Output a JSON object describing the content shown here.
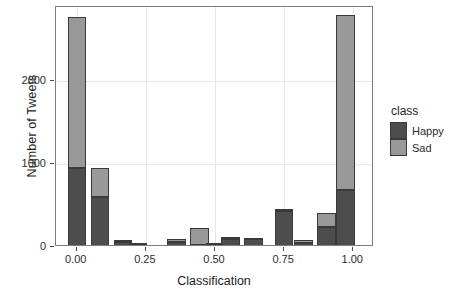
{
  "chart_data": {
    "type": "bar",
    "title": "",
    "xlabel": "Classification",
    "ylabel": "Number of Tweets",
    "xlim": [
      -0.075,
      1.075
    ],
    "ylim": [
      0,
      2900
    ],
    "xticks": [
      "0.00",
      "0.25",
      "0.50",
      "0.75",
      "1.00"
    ],
    "xtick_values": [
      0.0,
      0.25,
      0.5,
      0.75,
      1.0
    ],
    "yticks": [
      "0",
      "1000",
      "2000"
    ],
    "ytick_values": [
      0,
      1000,
      2000
    ],
    "grid": true,
    "stacked": true,
    "bin_width": 0.0667,
    "legend": {
      "title": "class",
      "position": "right",
      "entries": [
        {
          "label": "Happy",
          "color": "#4d4d4d"
        },
        {
          "label": "Sad",
          "color": "#999999"
        }
      ]
    },
    "series": [
      {
        "name": "Happy",
        "color": "#4d4d4d",
        "values": [
          950,
          600,
          60,
          40,
          10,
          60,
          30,
          35,
          100,
          100,
          440,
          50,
          240,
          690
        ]
      },
      {
        "name": "Sad",
        "color": "#999999",
        "values": [
          1830,
          360,
          25,
          10,
          5,
          35,
          195,
          15,
          15,
          10,
          20,
          35,
          170,
          2110
        ]
      }
    ],
    "bins": [
      {
        "x0": -0.0667,
        "x1": 0.0,
        "happy": 950,
        "sad": 1830,
        "total": 2780
      },
      {
        "x0": 0.0,
        "x1": 0.0667,
        "happy": 600,
        "sad": 360,
        "total": 960
      },
      {
        "x0": 0.0667,
        "x1": 0.1333,
        "happy": 60,
        "sad": 25,
        "total": 85
      },
      {
        "x0": 0.1333,
        "x1": 0.2,
        "happy": 40,
        "sad": 10,
        "total": 50
      },
      {
        "x0": 0.2,
        "x1": 0.2667,
        "happy": 10,
        "sad": 5,
        "total": 15
      },
      {
        "x0": 0.2667,
        "x1": 0.3333,
        "happy": 60,
        "sad": 35,
        "total": 95
      },
      {
        "x0": 0.3333,
        "x1": 0.4,
        "happy": 30,
        "sad": 195,
        "total": 225
      },
      {
        "x0": 0.4,
        "x1": 0.4667,
        "happy": 35,
        "sad": 15,
        "total": 50
      },
      {
        "x0": 0.4667,
        "x1": 0.5333,
        "happy": 100,
        "sad": 15,
        "total": 115
      },
      {
        "x0": 0.5333,
        "x1": 0.6,
        "happy": 100,
        "sad": 10,
        "total": 110
      },
      {
        "x0": 0.6,
        "x1": 0.6667,
        "happy": 440,
        "sad": 20,
        "total": 460
      },
      {
        "x0": 0.6667,
        "x1": 0.7333,
        "happy": 50,
        "sad": 35,
        "total": 85
      },
      {
        "x0": 0.7333,
        "x1": 0.8,
        "happy": 240,
        "sad": 170,
        "total": 410
      },
      {
        "x0": 0.8,
        "x1": 0.8667,
        "happy": 690,
        "sad": 2110,
        "total": 2800
      }
    ],
    "bin_centers_plot": [
      0.0,
      0.0833,
      0.1667,
      0.2222,
      0.2778,
      0.3611,
      0.4444,
      0.5,
      0.5556,
      0.6389,
      0.75,
      0.8194,
      0.9028,
      0.9722
    ]
  },
  "colors": {
    "happy": "#4d4d4d",
    "sad": "#999999",
    "bar_stroke": "#3a3a3a",
    "panel_border": "#7d7d7d",
    "gridline": "#e6e6e6",
    "background": "#ffffff",
    "text": "#1d1d1d"
  }
}
